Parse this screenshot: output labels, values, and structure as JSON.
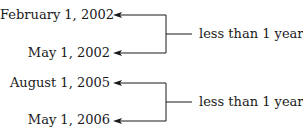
{
  "groups": [
    {
      "start_date": "February 1, 2002",
      "end_date": "May 1, 2002",
      "label": "less than 1 year"
    },
    {
      "start_date": "August 1, 2005",
      "end_date": "May 1, 2006",
      "label": "less than 1 year"
    }
  ]
}
